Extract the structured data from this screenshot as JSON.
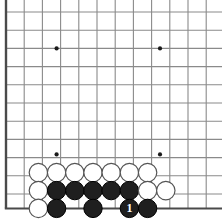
{
  "diagram": {
    "kind": "go-board-diagram",
    "board_size": 19,
    "visible_region": "lower-left corner",
    "colors": {
      "background": "#ffffff",
      "grid_line": "#8a8a8a",
      "edge_line": "#4a4a4a",
      "star_point": "#1a1a1a",
      "black_stone_fill": "#1f1f1f",
      "black_stone_edge": "#000000",
      "white_stone_fill": "#ffffff",
      "white_stone_edge": "#555555",
      "black_stone_label": "#ffffff"
    },
    "geometry": {
      "grid_spacing": 18.2,
      "origin_x": 6,
      "origin_y": 12,
      "columns_visible": 13,
      "rows_visible": 12,
      "left_edge_x": 6,
      "top_line_y": 12,
      "bottom_edge_y": 208.4,
      "stone_radius": 9.2,
      "label_font_size": 12
    },
    "star_points": [
      {
        "name": "star-point-upper-left",
        "x": 56.6,
        "y": 48.4
      },
      {
        "name": "star-point-upper-right",
        "x": 160,
        "y": 48.4
      },
      {
        "name": "star-point-lower-left",
        "x": 56.6,
        "y": 154.4
      },
      {
        "name": "star-point-lower-right",
        "x": 160,
        "y": 154.4
      }
    ],
    "stones": [
      {
        "id": "w1",
        "color": "white",
        "x": 38.4,
        "y": 172.6,
        "label": ""
      },
      {
        "id": "w2",
        "color": "white",
        "x": 56.6,
        "y": 172.6,
        "label": ""
      },
      {
        "id": "w3",
        "color": "white",
        "x": 74.8,
        "y": 172.6,
        "label": ""
      },
      {
        "id": "w4",
        "color": "white",
        "x": 93.0,
        "y": 172.6,
        "label": ""
      },
      {
        "id": "w5",
        "color": "white",
        "x": 111.2,
        "y": 172.6,
        "label": ""
      },
      {
        "id": "w6",
        "color": "white",
        "x": 129.4,
        "y": 172.6,
        "label": ""
      },
      {
        "id": "w7",
        "color": "white",
        "x": 147.6,
        "y": 172.6,
        "label": ""
      },
      {
        "id": "w8",
        "color": "white",
        "x": 38.4,
        "y": 190.6,
        "label": ""
      },
      {
        "id": "b1",
        "color": "black",
        "x": 56.6,
        "y": 190.6,
        "label": ""
      },
      {
        "id": "b2",
        "color": "black",
        "x": 74.8,
        "y": 190.6,
        "label": ""
      },
      {
        "id": "b3",
        "color": "black",
        "x": 93.0,
        "y": 190.6,
        "label": ""
      },
      {
        "id": "b4",
        "color": "black",
        "x": 111.2,
        "y": 190.6,
        "label": ""
      },
      {
        "id": "b5",
        "color": "black",
        "x": 129.4,
        "y": 190.6,
        "label": ""
      },
      {
        "id": "w9",
        "color": "white",
        "x": 147.6,
        "y": 190.6,
        "label": ""
      },
      {
        "id": "w10",
        "color": "white",
        "x": 165.8,
        "y": 190.6,
        "label": ""
      },
      {
        "id": "w11",
        "color": "white",
        "x": 38.4,
        "y": 208.4,
        "label": ""
      },
      {
        "id": "b6",
        "color": "black",
        "x": 56.6,
        "y": 208.4,
        "label": ""
      },
      {
        "id": "b7",
        "color": "black",
        "x": 93.0,
        "y": 208.4,
        "label": ""
      },
      {
        "id": "b8",
        "color": "black",
        "x": 129.4,
        "y": 208.4,
        "label": "1"
      },
      {
        "id": "b9",
        "color": "black",
        "x": 147.6,
        "y": 208.4,
        "label": ""
      }
    ],
    "move_markers": [
      {
        "number": "1",
        "color": "black",
        "x": 129.4,
        "y": 208.4
      }
    ]
  }
}
